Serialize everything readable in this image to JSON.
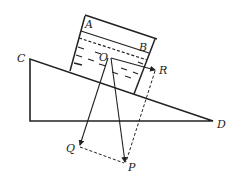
{
  "diagram": {
    "type": "physics-force-diagram",
    "labels": {
      "A": "A",
      "B": "B",
      "C": "C",
      "D": "D",
      "O": "O",
      "P": "P",
      "Q": "Q",
      "R": "R"
    },
    "colors": {
      "line": "#222222",
      "background": "#ffffff"
    },
    "elements": {
      "incline": {
        "vertices": [
          "C",
          "bottom-left corner",
          "D"
        ],
        "style": "solid"
      },
      "container": {
        "top_edge": "A-B",
        "walls": "perpendicular to incline",
        "style": "solid"
      },
      "liquid_surface": {
        "style": "dashed",
        "parallel_to": "AB"
      },
      "liquid_hatching": {
        "style": "short dashes"
      },
      "vectors": [
        {
          "from": "O",
          "to": "P",
          "style": "solid-arrow"
        },
        {
          "from": "O",
          "to": "Q",
          "style": "solid-arrow"
        },
        {
          "from": "O",
          "to": "R",
          "style": "solid-arrow"
        }
      ],
      "construction_lines": [
        {
          "from": "Q",
          "to": "P",
          "style": "dashed"
        },
        {
          "from": "R",
          "to": "P",
          "style": "dashed"
        }
      ]
    }
  }
}
